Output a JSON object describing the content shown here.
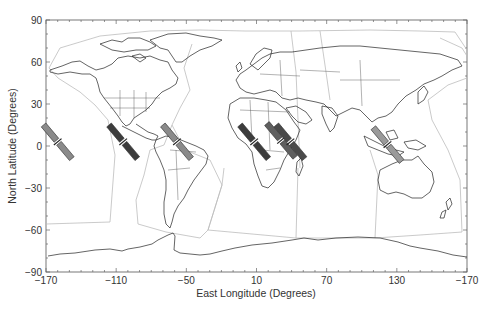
{
  "chart_data": {
    "type": "map",
    "title": "",
    "xlabel": "East Longitude (Degrees)",
    "ylabel": "North Latitude (Degrees)",
    "xlim": [
      -170,
      190
    ],
    "ylim": [
      -90,
      90
    ],
    "x_ticks": [
      "-170",
      "-110",
      "-50",
      "10",
      "70",
      "130",
      "-170"
    ],
    "y_ticks": [
      "90",
      "60",
      "30",
      "0",
      "-30",
      "-60",
      "-90"
    ],
    "grid": false,
    "layers": [
      "coastlines",
      "country borders",
      "US state borders",
      "gray region boundary polygons"
    ],
    "footprints": [
      {
        "lon": -160,
        "lat": 3,
        "shade": "light",
        "color": "#8a8a8a"
      },
      {
        "lon": -104,
        "lat": 3,
        "shade": "dark",
        "color": "#3c3c3c"
      },
      {
        "lon": -58,
        "lat": 3,
        "shade": "light",
        "color": "#8a8a8a"
      },
      {
        "lon": 8,
        "lat": 3,
        "shade": "dark",
        "color": "#3c3c3c"
      },
      {
        "lon": 31,
        "lat": 4,
        "shade": "medium",
        "color": "#5f5f5f"
      },
      {
        "lon": 39,
        "lat": 3,
        "shade": "dark",
        "color": "#4a4a4a"
      },
      {
        "lon": 122,
        "lat": 1,
        "shade": "light",
        "color": "#9a9a9a"
      }
    ]
  },
  "axes": {
    "xlabel": "East Longitude (Degrees)",
    "ylabel": "North Latitude (Degrees)",
    "x_ticks": [
      "-170",
      "-110",
      "-50",
      "10",
      "70",
      "130",
      "-170"
    ],
    "y_ticks": [
      "90",
      "60",
      "30",
      "0",
      "-30",
      "-60",
      "-90"
    ]
  }
}
